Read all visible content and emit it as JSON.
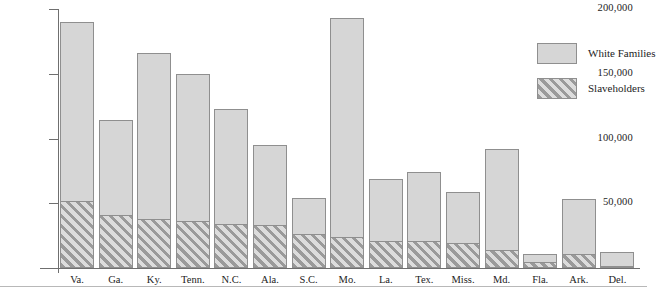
{
  "chart_data": {
    "type": "bar",
    "stacked": true,
    "title": "",
    "xlabel": "",
    "ylabel": "",
    "ylim": [
      0,
      200000
    ],
    "yticks": [
      50000,
      100000,
      150000,
      200000
    ],
    "ytick_labels": [
      "50,000",
      "100,000",
      "150,000",
      "200,000"
    ],
    "grid": false,
    "legend_position": "right",
    "categories": [
      "Va.",
      "Ga.",
      "Ky.",
      "Tenn.",
      "N.C.",
      "Ala.",
      "S.C.",
      "Mo.",
      "La.",
      "Tex.",
      "Miss.",
      "Md.",
      "Fla.",
      "Ark.",
      "Del."
    ],
    "series": [
      {
        "name": "White Families",
        "pattern": "solid",
        "color": "#d6d6d6",
        "values": [
          190000,
          114000,
          166000,
          150000,
          123000,
          95000,
          54000,
          193000,
          69000,
          74000,
          59000,
          92000,
          10500,
          53000,
          12000
        ]
      },
      {
        "name": "Slaveholders",
        "pattern": "diagonal-hatch",
        "color": "#9a9a9a",
        "values": [
          52000,
          41000,
          38000,
          36000,
          34000,
          33000,
          26000,
          24000,
          21000,
          21000,
          19000,
          14000,
          5000,
          11000,
          1800
        ]
      }
    ]
  },
  "legend": {
    "items": [
      {
        "label": "White Families",
        "swatch": "solid-gray"
      },
      {
        "label": "Slaveholders",
        "swatch": "hatched-gray"
      }
    ]
  }
}
